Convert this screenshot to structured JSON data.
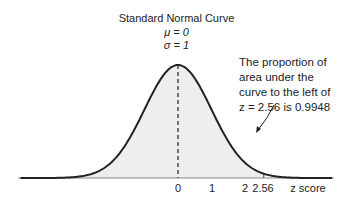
{
  "chart_data": {
    "type": "area",
    "title": "Standard Normal Curve",
    "subtitle": [
      "μ = 0",
      "σ = 1"
    ],
    "xlabel": "z score",
    "ylabel": "",
    "x_ticks": [
      "0",
      "1",
      "2",
      "2.56"
    ],
    "xlim": [
      -4.5,
      4.5
    ],
    "distribution": {
      "mean": 0,
      "sd": 1
    },
    "shaded_region": {
      "from": "-inf",
      "to": 2.56,
      "area": 0.9948
    },
    "reference_lines": [
      {
        "x": 0,
        "style": "dashed"
      },
      {
        "x": 2.56,
        "style": "solid"
      }
    ],
    "annotation": "The proportion of area under the curve to the left of z = 2.56 is 0.9948",
    "grid": false
  },
  "labels": {
    "title": "Standard Normal Curve",
    "mu": "μ = 0",
    "sigma": "σ = 1",
    "note_lines": [
      "The proportion of",
      "area under the",
      "curve to the left of",
      "z = 2.56 is 0.9948"
    ],
    "ticks": {
      "t0": "0",
      "t1": "1",
      "t2": "2",
      "t256": "2.56"
    },
    "xlabel": "z score"
  },
  "colors": {
    "curve": "#222222",
    "shade": "#eeeeee",
    "axis": "#888888"
  }
}
